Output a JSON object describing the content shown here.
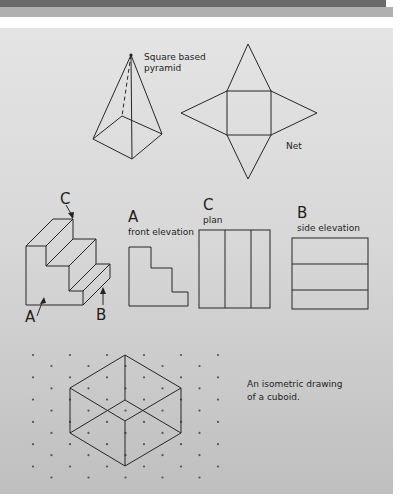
{
  "header_bars": {
    "dark_color": "#6a6a6a",
    "light_color": "#b0b0b0"
  },
  "panel": {
    "background": "#d9d9d9"
  },
  "pyramid": {
    "label_line1": "Square based",
    "label_line2": "pyramid"
  },
  "net": {
    "label": "Net"
  },
  "staircase": {
    "pointer_c": "C",
    "pointer_a": "A",
    "pointer_b": "B"
  },
  "views": [
    {
      "letter": "A",
      "caption": "front elevation"
    },
    {
      "letter": "C",
      "caption": "plan"
    },
    {
      "letter": "B",
      "caption": "side elevation"
    }
  ],
  "isometric": {
    "caption_line1": "An isometric drawing",
    "caption_line2": "of a cuboid."
  }
}
